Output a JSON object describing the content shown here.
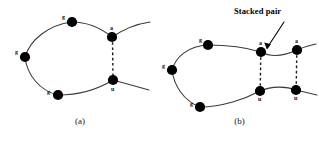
{
  "figure": {
    "background_color": "#ffffff",
    "stroke_color": "#3a3a3a",
    "node_color": "#000000",
    "dashed_color": "#1a1a1a",
    "annotation": {
      "label": "Stacked pair",
      "color": "#000000"
    }
  },
  "panels": [
    {
      "id": "a",
      "caption": "(a)",
      "nodes": [
        {
          "label": "g",
          "label_pos": "left",
          "cx": 72,
          "cy": 22
        },
        {
          "label": "g",
          "label_pos": "left",
          "cx": 25,
          "cy": 57
        },
        {
          "label": "g",
          "label_pos": "left",
          "cx": 58,
          "cy": 95
        },
        {
          "label": "a",
          "label_pos": "above",
          "cx": 112,
          "cy": 37
        },
        {
          "label": "u",
          "label_pos": "below",
          "cx": 113,
          "cy": 80
        }
      ],
      "base_pairs": [
        {
          "from": "a",
          "to": "u"
        }
      ]
    },
    {
      "id": "b",
      "caption": "(b)",
      "nodes": [
        {
          "label": "g",
          "label_pos": "left",
          "cx": 48,
          "cy": 45
        },
        {
          "label": "g",
          "label_pos": "left",
          "cx": 12,
          "cy": 70
        },
        {
          "label": "g",
          "label_pos": "left",
          "cx": 40,
          "cy": 107
        },
        {
          "label": "a",
          "label_pos": "above",
          "cx": 101,
          "cy": 52
        },
        {
          "label": "a",
          "label_pos": "above",
          "cx": 137,
          "cy": 50
        },
        {
          "label": "u",
          "label_pos": "below",
          "cx": 100,
          "cy": 91
        },
        {
          "label": "u",
          "label_pos": "below",
          "cx": 136,
          "cy": 90
        }
      ],
      "base_pairs": [
        {
          "from": "a1",
          "to": "u1"
        },
        {
          "from": "a2",
          "to": "u2"
        }
      ]
    }
  ]
}
